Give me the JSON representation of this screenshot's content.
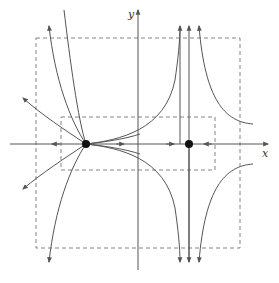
{
  "diagram": {
    "type": "phase-portrait",
    "axes": {
      "x_label": "x",
      "y_label": "y"
    },
    "equilibria": [
      {
        "name": "left-equilibrium",
        "px": [
          86,
          144
        ]
      },
      {
        "name": "right-equilibrium",
        "px": [
          189,
          144
        ]
      }
    ],
    "regions": [
      {
        "name": "outer-dashed-box",
        "px": [
          36,
          38,
          240,
          248
        ]
      },
      {
        "name": "inner-dashed-box",
        "px": [
          61,
          117,
          215,
          170
        ]
      }
    ],
    "colors": {
      "stroke": "#555555",
      "dash": "#666666",
      "point": "#111111",
      "background": "#ffffff"
    }
  }
}
